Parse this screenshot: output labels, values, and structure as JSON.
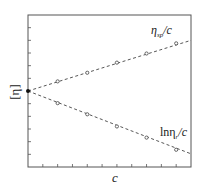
{
  "chart_data": {
    "type": "line",
    "title": "",
    "xlabel": "c",
    "ylabel": "[η]",
    "xlim": [
      0,
      11
    ],
    "ylim": [
      0,
      12
    ],
    "x_ticks": [
      1,
      2,
      3,
      4,
      5,
      6,
      7,
      8,
      9,
      10
    ],
    "y_ticks": [
      1,
      2,
      3,
      4,
      5,
      6,
      7,
      8,
      9,
      10,
      11
    ],
    "tick_labels_visible": false,
    "grid": false,
    "legend": "none (inline labels)",
    "intercept": {
      "x": 0,
      "y": 6.0,
      "label": "[η]",
      "marker": "filled-circle"
    },
    "series": [
      {
        "name": "η_sp/c",
        "label_main": "η",
        "label_sub": "sp",
        "label_tail": "/c",
        "style": "dashed",
        "marker": "open-circle",
        "x": [
          0,
          2,
          4,
          6,
          8,
          10
        ],
        "y": [
          6.0,
          6.76,
          7.44,
          8.24,
          8.96,
          9.76
        ],
        "line_extends_to": [
          11,
          10.0
        ]
      },
      {
        "name": "lnη_r/c",
        "label_main": "lnη",
        "label_sub": "r",
        "label_tail": "/c",
        "style": "dashed",
        "marker": "open-circle",
        "x": [
          0,
          2,
          4,
          6,
          8,
          10
        ],
        "y": [
          6.0,
          5.04,
          4.16,
          3.2,
          2.32,
          1.36
        ],
        "line_extends_to": [
          11,
          1.04
        ]
      }
    ],
    "colors": {
      "axis": "#555555",
      "line": "#444444",
      "marker": "#444444",
      "text": "#222222"
    }
  }
}
